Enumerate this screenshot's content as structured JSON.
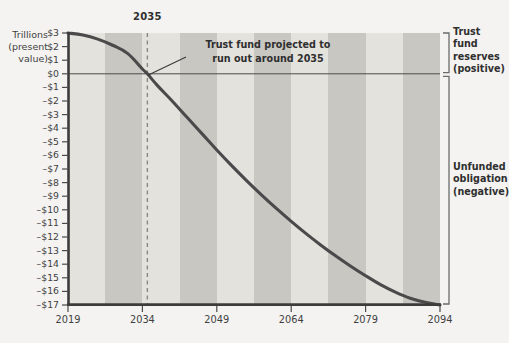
{
  "chart_data": {
    "type": "line",
    "title": "",
    "xlabel": "",
    "ylabel": "Trillions (present value)",
    "ylabel_lines": [
      "Trillions",
      "(present",
      "value)"
    ],
    "xlim": [
      2019,
      2094
    ],
    "ylim": [
      -17,
      3
    ],
    "grid": false,
    "legend": "none",
    "yticks": [
      "$3",
      "$2",
      "$1",
      "$0",
      "–$1",
      "–$2",
      "–$3",
      "–$4",
      "–$5",
      "–$6",
      "–$7",
      "–$8",
      "–$9",
      "–$10",
      "–$11",
      "–$12",
      "–$13",
      "–$14",
      "–$15",
      "–$16",
      "–$17"
    ],
    "ytick_values": [
      3,
      2,
      1,
      0,
      -1,
      -2,
      -3,
      -4,
      -5,
      -6,
      -7,
      -8,
      -9,
      -10,
      -11,
      -12,
      -13,
      -14,
      -15,
      -16,
      -17
    ],
    "xticks": [
      "2019",
      "2034",
      "2049",
      "2064",
      "2079",
      "2094"
    ],
    "xtick_values": [
      2019,
      2034,
      2049,
      2064,
      2079,
      2094
    ],
    "series": [
      {
        "name": "Cumulative trust fund balance (present value)",
        "x": [
          2019,
          2022,
          2025,
          2028,
          2031,
          2034,
          2035,
          2037,
          2040,
          2043,
          2046,
          2049,
          2052,
          2055,
          2058,
          2061,
          2064,
          2067,
          2070,
          2073,
          2076,
          2079,
          2082,
          2085,
          2088,
          2091,
          2094
        ],
        "values": [
          3.0,
          2.85,
          2.55,
          2.1,
          1.5,
          0.35,
          0.0,
          -0.85,
          -2.0,
          -3.2,
          -4.4,
          -5.6,
          -6.75,
          -7.85,
          -8.9,
          -9.9,
          -10.85,
          -11.75,
          -12.6,
          -13.4,
          -14.15,
          -14.85,
          -15.5,
          -16.05,
          -16.5,
          -16.8,
          -17.0
        ]
      }
    ],
    "zero_line_value": 0,
    "marker_line": {
      "label": "2035",
      "x_value": 2035
    },
    "annotation": {
      "lines": [
        "Trust fund projected to",
        "run out around 2035"
      ],
      "target_x": 2035,
      "target_y": 0
    },
    "brackets": [
      {
        "name": "positive",
        "lines": [
          "Trust fund",
          "reserves",
          "(positive)"
        ],
        "range": [
          0,
          3
        ]
      },
      {
        "name": "negative",
        "lines": [
          "Unfunded",
          "obligation",
          "(negative)"
        ],
        "range": [
          -17,
          0
        ]
      }
    ],
    "bands": {
      "description": "Alternating vertical shaded bands across plot width",
      "count": 10,
      "color_light": "#e4e2dd",
      "color_dark": "#c9c7c2"
    },
    "colors": {
      "background": "#f4f3f1",
      "line": "#4a4a4a",
      "axis": "#3c3c3c",
      "band_light": "#e4e2dd",
      "band_dark": "#c9c7c2",
      "text": "#3f3f3f"
    }
  },
  "watermark": {
    "text": ""
  }
}
